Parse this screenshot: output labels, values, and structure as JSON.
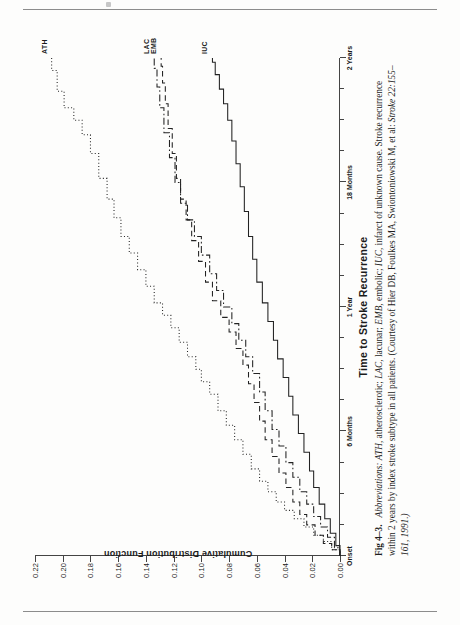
{
  "figure": {
    "label": "Fig 4–3.",
    "chart_title_axis_x": "Time to Stroke Recurrence",
    "axis_y_title": "Cumulative Distribution Function",
    "caption_lead": "Abbreviations:",
    "caption_body_1": "ATH,",
    "caption_body_2": "atherosclerotic;",
    "caption_body_3": "LAC,",
    "caption_body_4": "lacunar;",
    "caption_body_5": "EMB,",
    "caption_body_6": "embolic;",
    "caption_body_7": "IUC,",
    "caption_body_8": "infarct of unknown cause. Stroke recurrence within 2 years by index stroke subtype in all patients. (Courtesy of Hier DB, Foulkes MA, Swiontoniowski M, et al:",
    "caption_journal": "Stroke",
    "caption_citation": "22:155–161, 1991.)"
  },
  "chart_data": {
    "type": "line",
    "subtype": "step / cumulative-distribution (Kaplan-Meier style)",
    "title": "Time to Stroke Recurrence",
    "xlabel": "Time to Stroke Recurrence",
    "ylabel": "Cumulative Distribution Function",
    "xlim": [
      0,
      24
    ],
    "ylim": [
      0.0,
      0.22
    ],
    "grid": false,
    "legend_position": "inline end-of-curve labels",
    "x_tick_labels": [
      "Onset",
      "6 Months",
      "1 Year",
      "18 Months",
      "2 Years"
    ],
    "x_tick_values": [
      0,
      6,
      12,
      18,
      24
    ],
    "x_minor_tick_values": [
      1.5,
      3,
      4.5,
      7.5,
      9,
      10.5,
      13.5,
      15,
      16.5,
      19.5,
      21,
      22.5
    ],
    "y_tick_labels": [
      "0.00",
      "0.02",
      "0.04",
      "0.06",
      "0.08",
      "0.10",
      "0.12",
      "0.14",
      "0.16",
      "0.18",
      "0.20",
      "0.22"
    ],
    "y_tick_values": [
      0.0,
      0.02,
      0.04,
      0.06,
      0.08,
      0.1,
      0.12,
      0.14,
      0.16,
      0.18,
      0.2,
      0.22
    ],
    "series": [
      {
        "name": "ATH",
        "label": "ATH",
        "line_style": "dotted",
        "color": "#222222",
        "end_value": 0.208,
        "points": [
          [
            0.0,
            0.0
          ],
          [
            0.3,
            0.006
          ],
          [
            0.7,
            0.012
          ],
          [
            1.0,
            0.019
          ],
          [
            1.4,
            0.026
          ],
          [
            1.8,
            0.033
          ],
          [
            2.2,
            0.04
          ],
          [
            2.6,
            0.046
          ],
          [
            3.1,
            0.052
          ],
          [
            3.6,
            0.058
          ],
          [
            4.2,
            0.064
          ],
          [
            4.9,
            0.07
          ],
          [
            5.6,
            0.076
          ],
          [
            6.3,
            0.082
          ],
          [
            7.0,
            0.088
          ],
          [
            7.8,
            0.094
          ],
          [
            8.4,
            0.1
          ],
          [
            9.0,
            0.104
          ],
          [
            9.6,
            0.11
          ],
          [
            10.3,
            0.116
          ],
          [
            11.0,
            0.122
          ],
          [
            11.6,
            0.128
          ],
          [
            12.2,
            0.134
          ],
          [
            13.0,
            0.14
          ],
          [
            13.8,
            0.146
          ],
          [
            14.6,
            0.152
          ],
          [
            15.4,
            0.158
          ],
          [
            16.3,
            0.163
          ],
          [
            17.2,
            0.168
          ],
          [
            18.2,
            0.174
          ],
          [
            19.4,
            0.18
          ],
          [
            20.3,
            0.186
          ],
          [
            21.0,
            0.192
          ],
          [
            21.6,
            0.199
          ],
          [
            22.4,
            0.204
          ],
          [
            23.4,
            0.208
          ],
          [
            24.0,
            0.208
          ]
        ]
      },
      {
        "name": "LAC",
        "label": "LAC",
        "line_style": "dash-dot",
        "color": "#222222",
        "end_value": 0.134,
        "points": [
          [
            0.0,
            0.0
          ],
          [
            0.4,
            0.004
          ],
          [
            0.9,
            0.009
          ],
          [
            1.4,
            0.014
          ],
          [
            1.9,
            0.019
          ],
          [
            2.5,
            0.024
          ],
          [
            3.1,
            0.029
          ],
          [
            3.8,
            0.034
          ],
          [
            4.5,
            0.039
          ],
          [
            5.3,
            0.044
          ],
          [
            6.1,
            0.049
          ],
          [
            7.0,
            0.054
          ],
          [
            7.9,
            0.058
          ],
          [
            8.8,
            0.063
          ],
          [
            9.6,
            0.068
          ],
          [
            10.4,
            0.073
          ],
          [
            11.2,
            0.078
          ],
          [
            12.0,
            0.084
          ],
          [
            12.8,
            0.089
          ],
          [
            13.6,
            0.094
          ],
          [
            14.5,
            0.1
          ],
          [
            15.4,
            0.105
          ],
          [
            16.2,
            0.11
          ],
          [
            17.0,
            0.115
          ],
          [
            18.0,
            0.119
          ],
          [
            19.2,
            0.123
          ],
          [
            20.4,
            0.127
          ],
          [
            21.6,
            0.13
          ],
          [
            22.6,
            0.132
          ],
          [
            23.5,
            0.134
          ],
          [
            24.0,
            0.134
          ]
        ]
      },
      {
        "name": "EMB",
        "label": "EMB",
        "line_style": "dashed",
        "color": "#222222",
        "end_value": 0.129,
        "points": [
          [
            0.0,
            0.0
          ],
          [
            0.3,
            0.006
          ],
          [
            0.6,
            0.012
          ],
          [
            1.0,
            0.018
          ],
          [
            1.5,
            0.024
          ],
          [
            2.0,
            0.029
          ],
          [
            2.6,
            0.034
          ],
          [
            3.3,
            0.039
          ],
          [
            4.0,
            0.044
          ],
          [
            4.8,
            0.049
          ],
          [
            5.6,
            0.054
          ],
          [
            6.5,
            0.058
          ],
          [
            7.4,
            0.062
          ],
          [
            8.3,
            0.066
          ],
          [
            9.2,
            0.07
          ],
          [
            10.0,
            0.075
          ],
          [
            10.8,
            0.08
          ],
          [
            11.5,
            0.086
          ],
          [
            12.3,
            0.092
          ],
          [
            13.2,
            0.097
          ],
          [
            14.2,
            0.102
          ],
          [
            15.2,
            0.107
          ],
          [
            16.2,
            0.111
          ],
          [
            17.2,
            0.115
          ],
          [
            18.2,
            0.118
          ],
          [
            19.4,
            0.121
          ],
          [
            20.6,
            0.124
          ],
          [
            21.8,
            0.126
          ],
          [
            22.8,
            0.128
          ],
          [
            23.6,
            0.129
          ],
          [
            24.0,
            0.129
          ]
        ]
      },
      {
        "name": "IUC",
        "label": "IUC",
        "line_style": "solid",
        "color": "#222222",
        "end_value": 0.092,
        "points": [
          [
            0.0,
            0.0
          ],
          [
            0.5,
            0.003
          ],
          [
            1.1,
            0.007
          ],
          [
            1.8,
            0.011
          ],
          [
            2.5,
            0.015
          ],
          [
            3.3,
            0.019
          ],
          [
            4.1,
            0.022
          ],
          [
            5.0,
            0.026
          ],
          [
            5.9,
            0.03
          ],
          [
            6.8,
            0.034
          ],
          [
            7.7,
            0.037
          ],
          [
            8.6,
            0.041
          ],
          [
            9.5,
            0.045
          ],
          [
            10.4,
            0.048
          ],
          [
            11.3,
            0.052
          ],
          [
            12.2,
            0.056
          ],
          [
            13.2,
            0.06
          ],
          [
            14.3,
            0.063
          ],
          [
            15.4,
            0.066
          ],
          [
            16.6,
            0.069
          ],
          [
            17.8,
            0.072
          ],
          [
            18.9,
            0.075
          ],
          [
            20.0,
            0.078
          ],
          [
            21.0,
            0.081
          ],
          [
            21.8,
            0.084
          ],
          [
            22.5,
            0.087
          ],
          [
            23.2,
            0.09
          ],
          [
            23.8,
            0.092
          ],
          [
            24.0,
            0.092
          ]
        ]
      }
    ]
  }
}
